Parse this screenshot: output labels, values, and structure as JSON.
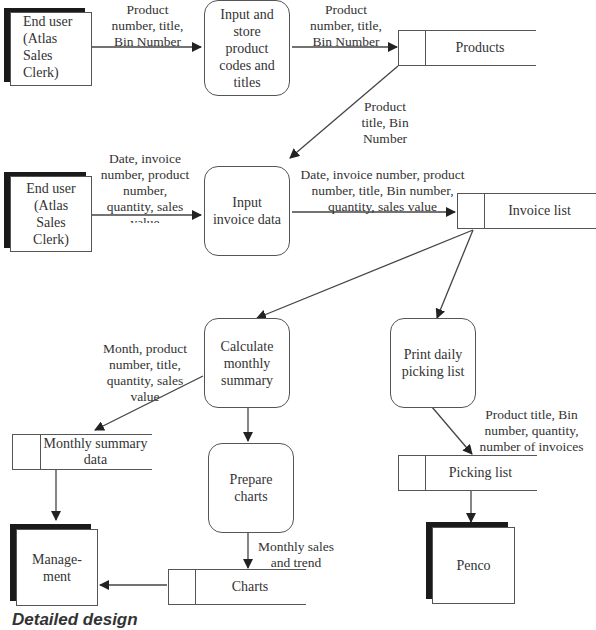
{
  "diagram": {
    "type": "data-flow-diagram",
    "caption": "Detailed design",
    "external_entities": [
      {
        "id": "clerk1",
        "label": "End user (Atlas Sales Clerk)",
        "lines": [
          "End user",
          "(Atlas",
          "Sales",
          "Clerk)"
        ]
      },
      {
        "id": "clerk2",
        "label": "End user (Atlas Sales Clerk)",
        "lines": [
          "End user",
          "(Atlas",
          "Sales",
          "Clerk)"
        ]
      },
      {
        "id": "management",
        "label": "Management",
        "lines": [
          "Manage-",
          "ment"
        ]
      },
      {
        "id": "penco",
        "label": "Penco",
        "lines": [
          "Penco"
        ]
      }
    ],
    "processes": [
      {
        "id": "p1",
        "lines": [
          "Input and",
          "store",
          "product",
          "codes and",
          "titles"
        ]
      },
      {
        "id": "p2",
        "lines": [
          "Input",
          "invoice data"
        ]
      },
      {
        "id": "p3",
        "lines": [
          "Calculate",
          "monthly",
          "summary"
        ]
      },
      {
        "id": "p4",
        "lines": [
          "Print daily",
          "picking list"
        ]
      },
      {
        "id": "p5",
        "lines": [
          "Prepare",
          "charts"
        ]
      }
    ],
    "data_stores": [
      {
        "id": "products",
        "label": "Products"
      },
      {
        "id": "invoice_list",
        "label": "Invoice list"
      },
      {
        "id": "monthly_summary",
        "lines": [
          "Monthly summary",
          "data"
        ]
      },
      {
        "id": "picking_list",
        "label": "Picking list"
      },
      {
        "id": "charts",
        "label": "Charts"
      }
    ],
    "flows": [
      {
        "from": "clerk1",
        "to": "p1",
        "lines": [
          "Product",
          "number, title,",
          "Bin Number"
        ]
      },
      {
        "from": "p1",
        "to": "products",
        "lines": [
          "Product",
          "number, title,",
          "Bin Number"
        ]
      },
      {
        "from": "products",
        "to": "p2",
        "lines": [
          "Product",
          "title, Bin",
          "Number"
        ]
      },
      {
        "from": "clerk2",
        "to": "p2",
        "lines": [
          "Date, invoice",
          "number, product",
          "number,",
          "quantity, sales",
          "value"
        ]
      },
      {
        "from": "p2",
        "to": "invoice_list",
        "lines": [
          "Date, invoice number, product",
          "number, title, Bin number,",
          "quantity, sales value"
        ]
      },
      {
        "from": "invoice_list",
        "to": "p3",
        "lines": []
      },
      {
        "from": "invoice_list",
        "to": "p4",
        "lines": []
      },
      {
        "from": "p3",
        "to": "monthly_summary",
        "lines": [
          "Month, product",
          "number, title,",
          "quantity, sales",
          "value"
        ]
      },
      {
        "from": "p3",
        "to": "p5",
        "lines": []
      },
      {
        "from": "p4",
        "to": "picking_list",
        "lines": [
          "Product title, Bin",
          "number, quantity,",
          "number of invoices"
        ]
      },
      {
        "from": "monthly_summary",
        "to": "management",
        "lines": []
      },
      {
        "from": "p5",
        "to": "charts",
        "lines": [
          "Monthly sales",
          "and trend"
        ]
      },
      {
        "from": "charts",
        "to": "management",
        "lines": []
      },
      {
        "from": "picking_list",
        "to": "penco",
        "lines": []
      }
    ]
  }
}
